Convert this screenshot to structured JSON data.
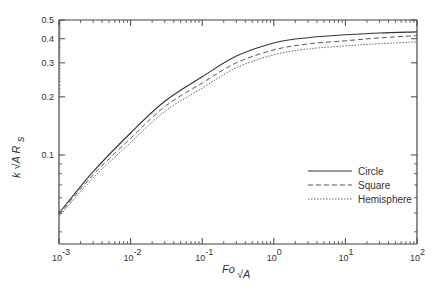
{
  "chart_data": {
    "type": "line",
    "title": "",
    "xlabel": "Fo_√A",
    "ylabel": "k √A R_s",
    "xscale": "log",
    "yscale": "log",
    "xlim": [
      0.001,
      100
    ],
    "ylim": [
      0.0346,
      0.5
    ],
    "grid": false,
    "legend_position": "lower right",
    "x": [
      0.001,
      0.003,
      0.01,
      0.03,
      0.1,
      0.3,
      1,
      3,
      10,
      30,
      100
    ],
    "x_tick_labels": [
      {
        "base": "10",
        "exp": "-3"
      },
      {
        "base": "10",
        "exp": "-2"
      },
      {
        "base": "10",
        "exp": "-1"
      },
      {
        "base": "10",
        "exp": "0"
      },
      {
        "base": "10",
        "exp": "1"
      },
      {
        "base": "10",
        "exp": "2"
      }
    ],
    "y_tick_labels": [
      "0.5",
      "0.4",
      "0.3",
      "0.2",
      "0.1"
    ],
    "series": [
      {
        "name": "Circle",
        "style": "solid",
        "color": "#333333",
        "values": [
          0.05,
          0.082,
          0.13,
          0.19,
          0.254,
          0.325,
          0.38,
          0.405,
          0.419,
          0.428,
          0.434
        ]
      },
      {
        "name": "Square",
        "style": "dashed",
        "color": "#555555",
        "values": [
          0.049,
          0.079,
          0.122,
          0.178,
          0.236,
          0.3,
          0.35,
          0.376,
          0.39,
          0.404,
          0.415
        ]
      },
      {
        "name": "Hemisphere",
        "style": "dotted",
        "color": "#666666",
        "values": [
          0.048,
          0.076,
          0.116,
          0.168,
          0.222,
          0.283,
          0.33,
          0.354,
          0.367,
          0.377,
          0.385
        ]
      }
    ]
  }
}
